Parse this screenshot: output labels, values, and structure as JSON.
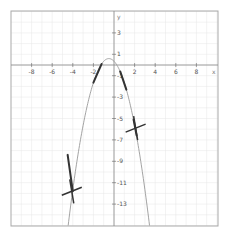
{
  "chart_data": {
    "type": "line",
    "title": "",
    "xlabel": "x",
    "ylabel": "y",
    "xlim": [
      -10.2,
      10
    ],
    "ylim": [
      -15.2,
      5
    ],
    "grid": true,
    "x_ticks": [
      -8,
      -6,
      -4,
      -2,
      2,
      4,
      6,
      8
    ],
    "y_ticks": [
      3,
      1,
      -1,
      -3,
      -5,
      -7,
      -9,
      -11,
      -13
    ],
    "series": [
      {
        "name": "parabola",
        "equation": "y = -(x+0.5)^2 + 0.6",
        "x": [
          -4.6,
          -4,
          -3,
          -2,
          -1,
          -0.5,
          0,
          1,
          2,
          2.6
        ],
        "y": [
          -16.2,
          -11.65,
          -5.65,
          -1.65,
          0.35,
          0.6,
          0.35,
          -1.65,
          -5.65,
          -9.0
        ]
      }
    ],
    "highlighted_segments": [
      {
        "from": [
          -2.0,
          -1.65
        ],
        "to": [
          -1.2,
          0.1
        ]
      },
      {
        "from": [
          0.6,
          -0.6
        ],
        "to": [
          1.2,
          -2.3
        ]
      },
      {
        "from": [
          1.9,
          -5.1
        ],
        "to": [
          2.2,
          -6.6
        ]
      },
      {
        "from": [
          -4.5,
          -8.4
        ],
        "to": [
          -4.0,
          -11.8
        ]
      }
    ],
    "markers": [
      {
        "type": "cross",
        "x": 2.1,
        "y": -5.9
      },
      {
        "type": "cross",
        "x": -4.1,
        "y": -11.8
      }
    ]
  },
  "axes": {
    "x_label": "x",
    "y_label": "y",
    "x_tick_labels": [
      "-8",
      "-6",
      "-4",
      "-2",
      "2",
      "4",
      "6",
      "8"
    ],
    "y_tick_labels": [
      "3",
      "1",
      "-1",
      "-3",
      "-5",
      "-7",
      "-9",
      "-11",
      "-13"
    ]
  },
  "colors": {
    "grid": "#e6e6e6",
    "axis": "#888888",
    "curve": "#999999",
    "highlight": "#333333",
    "frame": "#aaaaaa"
  }
}
